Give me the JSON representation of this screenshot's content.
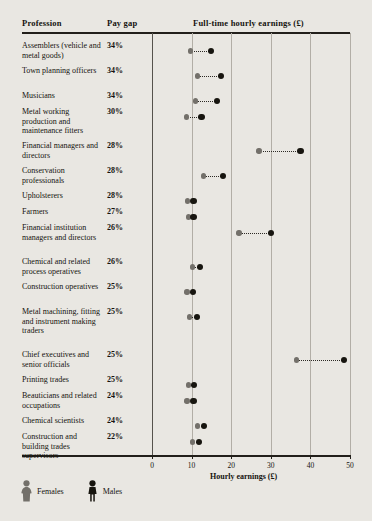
{
  "header": {
    "col_profession": "Profession",
    "col_paygap": "Pay gap",
    "col_earnings": "Full-time hourly earnings (£)"
  },
  "legend": {
    "females": "Females",
    "males": "Males",
    "female_color": "#73706a",
    "male_color": "#17150f"
  },
  "axis": {
    "title": "Hourly earnings (£)",
    "ticks": [
      "0",
      "10",
      "20",
      "30",
      "40",
      "50"
    ]
  },
  "chart_data": {
    "type": "scatter",
    "title": "Full-time hourly earnings (£)",
    "xlabel": "Hourly earnings (£)",
    "ylabel": "Profession",
    "xlim": [
      0,
      50
    ],
    "grid": true,
    "legend_position": "bottom-left",
    "series": [
      {
        "name": "Females",
        "color": "#73706a"
      },
      {
        "name": "Males",
        "color": "#17150f"
      }
    ],
    "categories": [
      "Assemblers (vehicle and metal goods)",
      "Town planning officers",
      "Musicians",
      "Metal working production and maintenance fitters",
      "Financial managers and directors",
      "Conservation professionals",
      "Upholsterers",
      "Farmers",
      "Financial institution managers and directors",
      "Chemical and related process operatives",
      "Construction operatives",
      "Metal machining, fitting and instrument making traders",
      "Chief executives and senior officials",
      "Printing trades",
      "Beauticians and related occupations",
      "Chemical scientists",
      "Construction and building trades supervisors"
    ],
    "pay_gap": [
      "34%",
      "34%",
      "34%",
      "30%",
      "28%",
      "28%",
      "28%",
      "27%",
      "26%",
      "26%",
      "25%",
      "25%",
      "25%",
      "25%",
      "24%",
      "24%",
      "22%"
    ],
    "females": [
      9.8,
      11.5,
      11.0,
      8.7,
      27.0,
      13.0,
      9.0,
      9.2,
      22.0,
      10.3,
      8.8,
      9.5,
      36.5,
      9.2,
      8.8,
      11.5,
      10.3
    ],
    "males": [
      14.8,
      17.5,
      16.5,
      12.5,
      37.5,
      18.0,
      10.5,
      10.5,
      30.0,
      12.2,
      10.3,
      11.3,
      48.5,
      10.7,
      10.5,
      13.2,
      11.8
    ]
  },
  "rows": [
    {
      "profession": "Assemblers (vehicle and metal goods)",
      "pay_gap": "34%",
      "female": 9.8,
      "male": 14.8
    },
    {
      "profession": "Town planning officers",
      "pay_gap": "34%",
      "female": 11.5,
      "male": 17.5
    },
    {
      "profession": "Musicians",
      "pay_gap": "34%",
      "female": 11.0,
      "male": 16.5
    },
    {
      "profession": "Metal working production and maintenance fitters",
      "pay_gap": "30%",
      "female": 8.7,
      "male": 12.5
    },
    {
      "profession": "Financial managers and directors",
      "pay_gap": "28%",
      "female": 27.0,
      "male": 37.5
    },
    {
      "profession": "Conservation professionals",
      "pay_gap": "28%",
      "female": 13.0,
      "male": 18.0
    },
    {
      "profession": "Upholsterers",
      "pay_gap": "28%",
      "female": 9.0,
      "male": 10.5
    },
    {
      "profession": "Farmers",
      "pay_gap": "27%",
      "female": 9.2,
      "male": 10.5
    },
    {
      "profession": "Financial institution managers and directors",
      "pay_gap": "26%",
      "female": 22.0,
      "male": 30.0
    },
    {
      "profession": "Chemical and related process operatives",
      "pay_gap": "26%",
      "female": 10.3,
      "male": 12.2
    },
    {
      "profession": "Construction operatives",
      "pay_gap": "25%",
      "female": 8.8,
      "male": 10.3
    },
    {
      "profession": "Metal machining, fitting and instrument making traders",
      "pay_gap": "25%",
      "female": 9.5,
      "male": 11.3
    },
    {
      "profession": "Chief executives and senior officials",
      "pay_gap": "25%",
      "female": 36.5,
      "male": 48.5
    },
    {
      "profession": "Printing trades",
      "pay_gap": "25%",
      "female": 9.2,
      "male": 10.7
    },
    {
      "profession": "Beauticians and related occupations",
      "pay_gap": "24%",
      "female": 8.8,
      "male": 10.5
    },
    {
      "profession": "Chemical scientists",
      "pay_gap": "24%",
      "female": 11.5,
      "male": 13.2
    },
    {
      "profession": "Construction and building trades supervisors",
      "pay_gap": "22%",
      "female": 10.3,
      "male": 11.8
    }
  ]
}
